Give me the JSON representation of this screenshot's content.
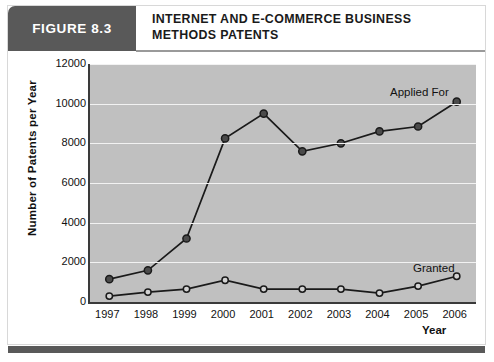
{
  "figure": {
    "tag": "FIGURE 8.3",
    "title": "INTERNET AND E-COMMERCE BUSINESS METHODS PATENTS"
  },
  "chart_data": {
    "type": "line",
    "title": "Internet and E-Commerce Business Methods Patents",
    "xlabel": "Year",
    "ylabel": "Number of Patents per Year",
    "categories": [
      "1997",
      "1998",
      "1999",
      "2000",
      "2001",
      "2002",
      "2003",
      "2004",
      "2005",
      "2006"
    ],
    "ylim": [
      0,
      12000
    ],
    "yticks": [
      "0",
      "2000",
      "4000",
      "6000",
      "8000",
      "10000",
      "12000"
    ],
    "grid": true,
    "legend_position": "inline-annotation",
    "series": [
      {
        "name": "Applied For",
        "marker": "filled-circle",
        "color": "#1a1a1a",
        "values": [
          1150,
          1600,
          3200,
          8250,
          9500,
          7600,
          8000,
          8600,
          8850,
          10100
        ]
      },
      {
        "name": "Granted",
        "marker": "open-circle",
        "color": "#1a1a1a",
        "values": [
          300,
          500,
          650,
          1100,
          650,
          650,
          650,
          450,
          800,
          1300
        ]
      }
    ],
    "annotations": [
      {
        "text": "Applied For",
        "series": "Applied For"
      },
      {
        "text": "Granted",
        "series": "Granted"
      }
    ]
  },
  "colors": {
    "header_bar": "#595959",
    "plot_background": "#c0c0c0",
    "gridline": "#f2f2f2",
    "axis": "#3a3a3a",
    "line": "#1a1a1a"
  }
}
